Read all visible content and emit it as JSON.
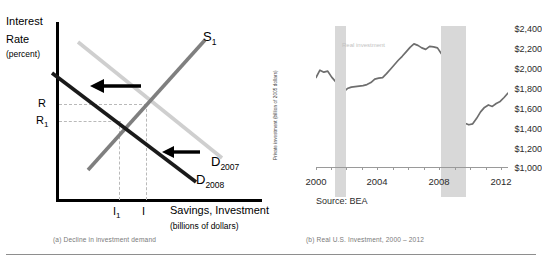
{
  "figure": {
    "captions": {
      "a": "(a) Decline in investment demand",
      "b": "(b) Real U.S. Investment, 2000 – 2012"
    }
  },
  "panel_a": {
    "title_line1": "Interest",
    "title_line2": "Rate",
    "title_line3": "(percent)",
    "x_axis_label": "Savings, Investment",
    "x_axis_sublabel": "(billions of dollars)",
    "y_ticks": [
      {
        "label": "R",
        "sub": ""
      },
      {
        "label": "R",
        "sub": "1"
      }
    ],
    "x_ticks": [
      {
        "label": "I",
        "sub": "1"
      },
      {
        "label": "I",
        "sub": ""
      }
    ],
    "curves": [
      {
        "name": "supply",
        "label": "S",
        "sub": "1",
        "color": "#808080"
      },
      {
        "name": "demand-2007",
        "label": "D",
        "sub": "2007",
        "color": "#c8c8c8"
      },
      {
        "name": "demand-2008",
        "label": "D",
        "sub": "2008",
        "color": "#000000"
      }
    ],
    "arrows": [
      {
        "name": "shift-arrow-upper",
        "direction": "left"
      },
      {
        "name": "shift-arrow-lower",
        "direction": "left"
      }
    ]
  },
  "chart_data": {
    "type": "line",
    "title": "",
    "subtitle": "",
    "xlabel": "",
    "ylabel": "Private investment (billion of 2005 dollars)",
    "source": "Source: BEA",
    "series_label": "Real investment",
    "legend_position": "inline-annotation",
    "grid": false,
    "xlim": [
      2000,
      2012.25
    ],
    "ylim": [
      1000,
      2400
    ],
    "y_ticks": [
      "$2,400",
      "$2,200",
      "$2,000",
      "$1,800",
      "$1,600",
      "$1,400",
      "$1,200",
      "$1,000"
    ],
    "y_tick_values": [
      2400,
      2200,
      2000,
      1800,
      1600,
      1400,
      1200,
      1000
    ],
    "x_ticks": [
      "2000",
      "2004",
      "2008",
      "2012"
    ],
    "x_tick_values": [
      2000,
      2004,
      2008,
      2012
    ],
    "shaded_bands": [
      {
        "name": "recession-2001",
        "start": 2001.2,
        "end": 2001.9
      },
      {
        "name": "recession-2008",
        "start": 2007.9,
        "end": 2009.5
      }
    ],
    "series": [
      {
        "name": "Real investment",
        "color": "#6e6e6e",
        "x": [
          2000.0,
          2000.25,
          2000.5,
          2000.75,
          2001.0,
          2001.25,
          2001.5,
          2001.75,
          2002.0,
          2002.25,
          2002.5,
          2002.75,
          2003.0,
          2003.25,
          2003.5,
          2003.75,
          2004.0,
          2004.25,
          2004.5,
          2004.75,
          2005.0,
          2005.25,
          2005.5,
          2005.75,
          2006.0,
          2006.25,
          2006.5,
          2006.75,
          2007.0,
          2007.25,
          2007.5,
          2007.75,
          2008.0,
          2008.25,
          2008.5,
          2008.75,
          2009.0,
          2009.25,
          2009.5,
          2009.75,
          2010.0,
          2010.25,
          2010.5,
          2010.75,
          2011.0,
          2011.25,
          2011.5,
          2011.75,
          2012.0,
          2012.25
        ],
        "y": [
          1900,
          1975,
          1955,
          1965,
          1905,
          1860,
          1840,
          1755,
          1790,
          1805,
          1810,
          1815,
          1820,
          1830,
          1850,
          1885,
          1895,
          1900,
          1940,
          1985,
          2030,
          2075,
          2115,
          2160,
          2205,
          2240,
          2225,
          2200,
          2185,
          2215,
          2210,
          2200,
          2140,
          2095,
          1990,
          1860,
          1690,
          1545,
          1440,
          1425,
          1435,
          1490,
          1555,
          1600,
          1625,
          1610,
          1640,
          1660,
          1700,
          1745
        ]
      }
    ]
  }
}
